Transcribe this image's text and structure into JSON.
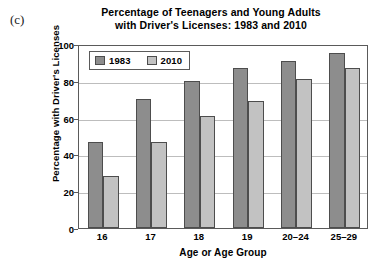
{
  "panel_label": "(c)",
  "chart_data": {
    "type": "bar",
    "title": "Percentage of Teenagers and Young Adults with Driver's Licenses: 1983 and 2010",
    "title_lines": [
      "Percentage of Teenagers and Young Adults",
      "with Driver's Licenses: 1983 and 2010"
    ],
    "xlabel": "Age or Age Group",
    "ylabel": "Percentage with Driver's Licenses",
    "categories": [
      "16",
      "17",
      "18",
      "19",
      "20–24",
      "25–29"
    ],
    "series": [
      {
        "name": "1983",
        "color": "#8d8d8d",
        "values": [
          47,
          70,
          80,
          87,
          91,
          95
        ]
      },
      {
        "name": "2010",
        "color": "#c2c2c2",
        "values": [
          28,
          47,
          61,
          69,
          81,
          87
        ]
      }
    ],
    "ylim": [
      0,
      100
    ],
    "yticks": [
      0,
      20,
      40,
      60,
      80,
      100
    ],
    "ytick_labels": [
      "0",
      "20",
      "40",
      "60",
      "80",
      "100"
    ],
    "grid": true,
    "legend_position": "top-left"
  }
}
